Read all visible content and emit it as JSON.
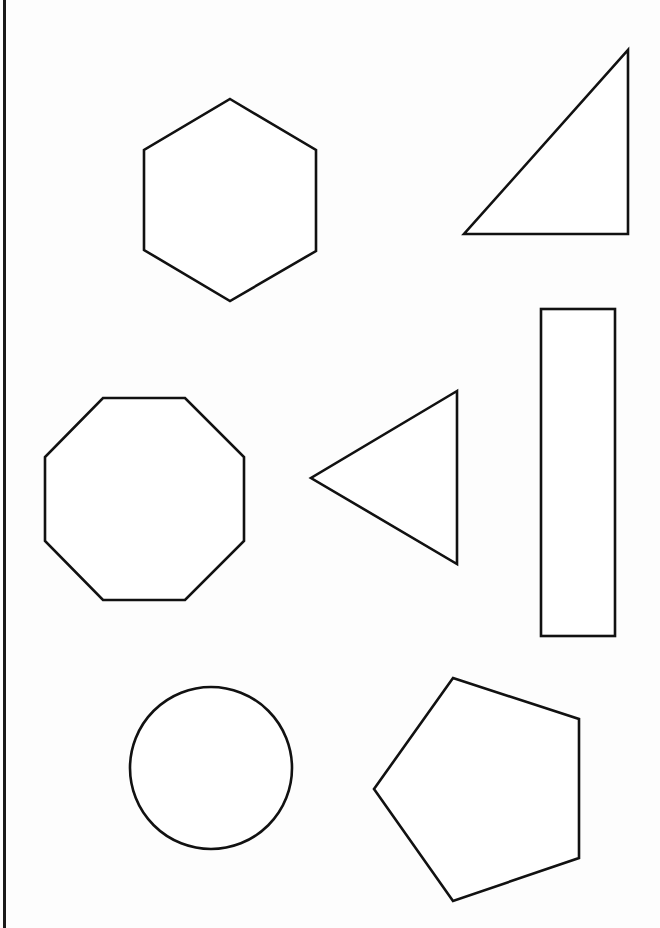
{
  "page": {
    "width": 660,
    "height": 928,
    "background": "#fdfdfd",
    "stroke_color": "#111111",
    "left_rule_color": "#1a1a1a"
  },
  "shapes": [
    {
      "name": "hexagon",
      "type": "polygon",
      "points": [
        [
          230,
          99
        ],
        [
          316,
          150
        ],
        [
          316,
          251
        ],
        [
          230,
          301
        ],
        [
          144,
          250
        ],
        [
          144,
          150
        ]
      ]
    },
    {
      "name": "right-triangle",
      "type": "polygon",
      "points": [
        [
          628,
          50
        ],
        [
          628,
          234
        ],
        [
          464,
          234
        ]
      ]
    },
    {
      "name": "octagon",
      "type": "polygon",
      "points": [
        [
          103,
          398
        ],
        [
          185,
          398
        ],
        [
          244,
          457
        ],
        [
          244,
          541
        ],
        [
          185,
          600
        ],
        [
          103,
          600
        ],
        [
          45,
          541
        ],
        [
          45,
          457
        ]
      ]
    },
    {
      "name": "triangle-pointing-left",
      "type": "polygon",
      "points": [
        [
          457,
          391
        ],
        [
          311,
          478
        ],
        [
          457,
          564
        ]
      ]
    },
    {
      "name": "tall-rectangle",
      "type": "rect",
      "x": 541,
      "y": 309,
      "width": 74,
      "height": 327
    },
    {
      "name": "circle",
      "type": "circle",
      "cx": 211,
      "cy": 768,
      "r": 81
    },
    {
      "name": "pentagon",
      "type": "polygon",
      "points": [
        [
          453,
          678
        ],
        [
          579,
          719
        ],
        [
          579,
          858
        ],
        [
          453,
          901
        ],
        [
          374,
          789
        ]
      ]
    }
  ]
}
